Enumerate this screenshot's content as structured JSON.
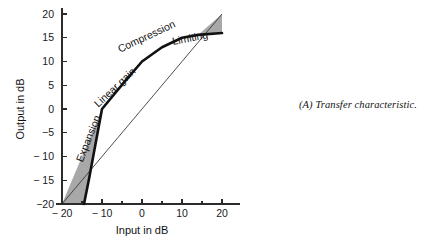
{
  "figure": {
    "caption": "(A) Transfer characteristic."
  },
  "chart_data": {
    "type": "line",
    "title": "",
    "xlabel": "Input in dB",
    "ylabel": "Output in dB",
    "xlim": [
      -20,
      20
    ],
    "ylim": [
      -20,
      20
    ],
    "grid": false,
    "legend": "none",
    "x_ticks_major": [
      -20,
      -10,
      0,
      10,
      20
    ],
    "x_tick_labels": [
      "− 20",
      "− 10",
      "0",
      "10",
      "20"
    ],
    "x_ticks_minor": [
      -15,
      -5,
      5,
      15
    ],
    "y_ticks_major": [
      -20,
      -15,
      -10,
      -5,
      0,
      5,
      10,
      15,
      20
    ],
    "y_tick_labels": [
      "−20",
      "− 15",
      "− 10",
      "−5",
      "0",
      "5",
      "10",
      "15",
      "20"
    ],
    "series": [
      {
        "name": "transfer-characteristic",
        "style": "thick-solid",
        "points": [
          [
            -14.5,
            -20
          ],
          [
            -13.2,
            -14.5
          ],
          [
            -10,
            0
          ],
          [
            -4.5,
            5.6
          ],
          [
            0,
            10
          ],
          [
            5,
            13
          ],
          [
            10,
            15
          ],
          [
            14,
            15.6
          ],
          [
            20,
            16
          ]
        ]
      },
      {
        "name": "unity-gain-reference",
        "style": "thin-solid",
        "points": [
          [
            -20,
            -20
          ],
          [
            20,
            20
          ]
        ]
      }
    ],
    "shaded_regions": [
      {
        "name": "expansion-region",
        "color": "#a8a8a8",
        "polygon": [
          [
            -20,
            -20
          ],
          [
            -14.5,
            -20
          ],
          [
            -13.2,
            -14.5
          ],
          [
            -10,
            0
          ]
        ]
      },
      {
        "name": "limiting-region",
        "color": "#a8a8a8",
        "polygon": [
          [
            14,
            15.6
          ],
          [
            20,
            16
          ],
          [
            20,
            20
          ]
        ]
      }
    ],
    "annotations": [
      {
        "name": "expansion",
        "text": "Expansion",
        "x": -12.6,
        "y": -6.5,
        "rotation": -68
      },
      {
        "name": "linear-gain",
        "text": "Linear gain",
        "x": -6.2,
        "y": 4.0,
        "rotation": -43
      },
      {
        "name": "compression",
        "text": "Compression",
        "x": 1.5,
        "y": 14.6,
        "rotation": -25
      },
      {
        "name": "limiting",
        "text": "Limiting",
        "x": 12.2,
        "y": 14.2,
        "rotation": -11
      }
    ],
    "colors": {
      "curve": "#111111",
      "unity_line": "#3a3a3a",
      "shade": "#a8a8a8",
      "axis": "#2b2b2b",
      "background": "#ffffff"
    }
  }
}
